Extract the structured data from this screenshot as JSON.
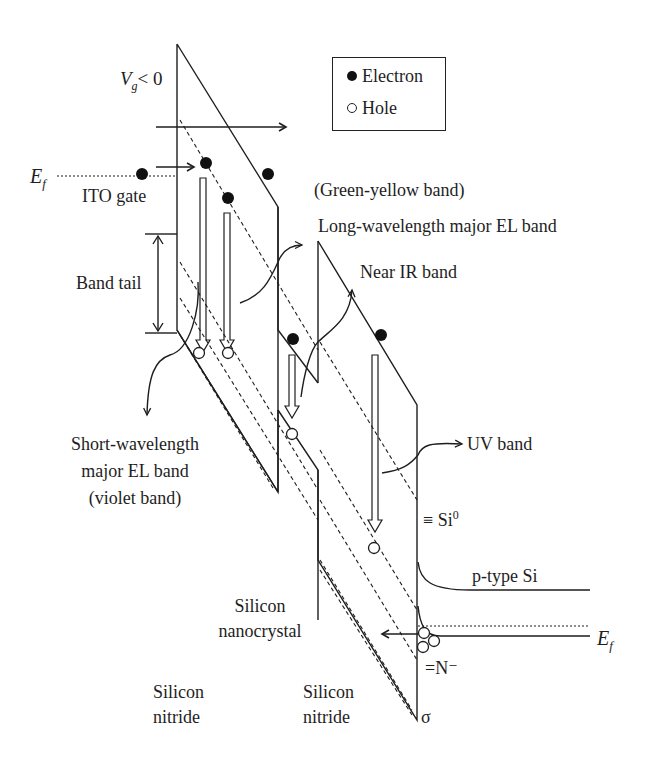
{
  "figure": {
    "gate_voltage": {
      "symbol": "V",
      "subscript": "g",
      "relation": "< 0"
    },
    "fermi_left": {
      "symbol": "E",
      "subscript": "f"
    },
    "fermi_right": {
      "symbol": "E",
      "subscript": "f"
    },
    "legend": {
      "items": [
        {
          "label": "Electron",
          "marker": "filled-circle"
        },
        {
          "label": "Hole",
          "marker": "open-circle"
        }
      ]
    },
    "labels": {
      "ito_gate": "ITO gate",
      "band_tail": "Band tail",
      "green_yellow": "(Green-yellow band)",
      "long_wavelength": "Long-wavelength major EL band",
      "near_ir": "Near IR band",
      "short_wavelength_1": "Short-wavelength",
      "short_wavelength_2": "major EL band",
      "short_wavelength_3": "(violet band)",
      "uv_band": "UV band",
      "si0_prefix": "≡ Si",
      "si0_sup": "0",
      "p_type_si": "p-type Si",
      "silicon_nanocrystal_1": "Silicon",
      "silicon_nanocrystal_2": "nanocrystal",
      "silicon_nitride_left_1": "Silicon",
      "silicon_nitride_left_2": "nitride",
      "silicon_nitride_right_1": "Silicon",
      "silicon_nitride_right_2": "nitride",
      "n_minus": "=N⁻",
      "sigma": "σ"
    },
    "colors": {
      "line": "#1e1e1e",
      "background": "#ffffff"
    }
  }
}
